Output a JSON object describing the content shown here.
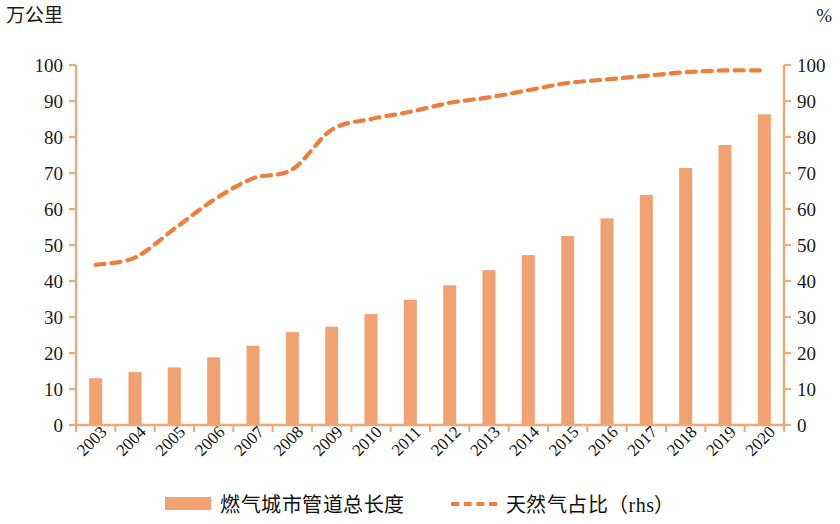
{
  "chart_data": {
    "type": "bar",
    "title": "",
    "subtitle": "",
    "xlabel": "",
    "ylabel": "万公里",
    "y2label": "%",
    "ylim": [
      0,
      100
    ],
    "y2lim": [
      0,
      100
    ],
    "yticks": [
      0,
      10,
      20,
      30,
      40,
      50,
      60,
      70,
      80,
      90,
      100
    ],
    "y2ticks": [
      0,
      10,
      20,
      30,
      40,
      50,
      60,
      70,
      80,
      90,
      100
    ],
    "grid": false,
    "legend_position": "bottom",
    "categories": [
      "2003",
      "2004",
      "2005",
      "2006",
      "2007",
      "2008",
      "2009",
      "2010",
      "2011",
      "2012",
      "2013",
      "2014",
      "2015",
      "2016",
      "2017",
      "2018",
      "2019",
      "2020"
    ],
    "series": [
      {
        "name": "燃气城市管道总长度",
        "type": "bar",
        "axis": "left",
        "unit": "万公里",
        "color": "#F2A171",
        "values": [
          13.0,
          14.7,
          16.0,
          18.8,
          22.0,
          25.8,
          27.3,
          30.8,
          34.8,
          38.8,
          43.0,
          47.2,
          52.5,
          57.4,
          63.9,
          71.4,
          77.8,
          86.3
        ]
      },
      {
        "name": "天然气占比（rhs）",
        "type": "line",
        "style": "dashed",
        "axis": "right",
        "unit": "%",
        "color": "#EE7E3C",
        "values": [
          44.5,
          46.5,
          54.5,
          62.5,
          68.5,
          71.0,
          82.0,
          85.0,
          87.0,
          89.5,
          91.0,
          93.0,
          95.0,
          96.0,
          97.0,
          98.0,
          98.5,
          98.5
        ]
      }
    ]
  },
  "legend": {
    "entries": [
      {
        "label": "燃气城市管道总长度",
        "marker": "bar-swatch",
        "color": "#F2A171"
      },
      {
        "label": "天然气占比（rhs）",
        "marker": "dashed-line-swatch",
        "color": "#EE7E3C"
      }
    ]
  },
  "axes": {
    "left_unit": "万公里",
    "right_unit": "%"
  }
}
